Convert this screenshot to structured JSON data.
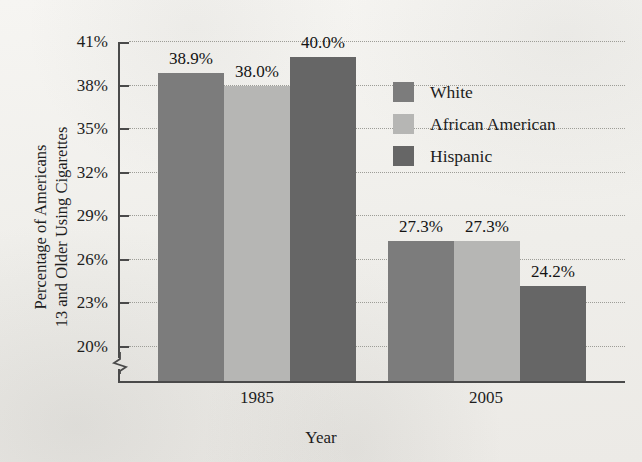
{
  "chart_data": {
    "type": "bar",
    "title": "",
    "xlabel": "Year",
    "ylabel": "Percentage of Americans 13 and Older Using Cigarettes",
    "ylabel_lines": [
      "Percentage of Americans",
      "13 and Older Using Cigarettes"
    ],
    "categories": [
      "1985",
      "2005"
    ],
    "series": [
      {
        "name": "White",
        "values": [
          38.9,
          27.3
        ],
        "color": "#7c7c7c"
      },
      {
        "name": "African American",
        "values": [
          38.0,
          27.3
        ],
        "color": "#b6b6b4"
      },
      {
        "name": "Hispanic",
        "values": [
          40.0,
          24.2
        ],
        "color": "#666666"
      }
    ],
    "value_labels": [
      [
        "38.9%",
        "38.0%",
        "40.0%"
      ],
      [
        "27.3%",
        "27.3%",
        "24.2%"
      ]
    ],
    "ylim": [
      20,
      41
    ],
    "y_ticks": [
      20,
      23,
      26,
      29,
      32,
      35,
      38,
      41
    ],
    "y_tick_labels": [
      "20%",
      "23%",
      "26%",
      "29%",
      "32%",
      "35%",
      "38%",
      "41%"
    ],
    "axis_broken": true,
    "axis_break_note": "zigzag break below 20%",
    "grid": "horizontal-dotted",
    "legend_position": "upper-right-inside"
  },
  "legend": {
    "items": [
      {
        "label": "White",
        "color": "#7c7c7c"
      },
      {
        "label": "African American",
        "color": "#b6b6b4"
      },
      {
        "label": "Hispanic",
        "color": "#666666"
      }
    ]
  },
  "axes": {
    "y_title_line1": "Percentage of Americans",
    "y_title_line2": "13 and Older Using Cigarettes",
    "x_title": "Year"
  }
}
